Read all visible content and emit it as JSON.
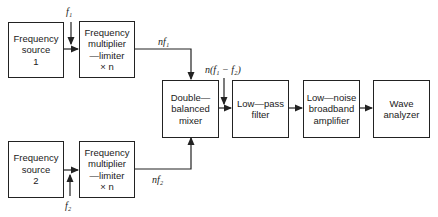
{
  "diagram": {
    "boxes": [
      {
        "id": "freq-source-1",
        "label": "Frequency\nsource\n1"
      },
      {
        "id": "freq-mult-1",
        "label": "Frequency\nmultiplier\n—limiter\n×  n"
      },
      {
        "id": "freq-source-2",
        "label": "Frequency\nsource\n2"
      },
      {
        "id": "freq-mult-2",
        "label": "Frequency\nmultiplier\n—limiter\n×  n"
      },
      {
        "id": "mixer",
        "label": "Double—\nbalanced\nmixer"
      },
      {
        "id": "low-pass",
        "label": "Low—pass\nfilter"
      },
      {
        "id": "amplifier",
        "label": "Low—noise\nbroadband\namplifier"
      },
      {
        "id": "wave-analyzer",
        "label": "Wave\nanalyzer"
      }
    ],
    "signals": {
      "f1": "f₁",
      "f2": "f₂",
      "nf1": "nf₁",
      "nf2": "nf₂",
      "diff": "n(f₁ − f₂)"
    },
    "colors": {
      "line": "#222222",
      "background": "#ffffff"
    }
  }
}
